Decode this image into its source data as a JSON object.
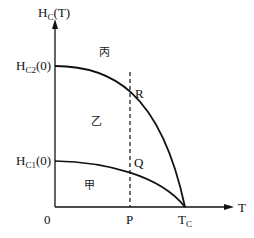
{
  "diagram": {
    "y_axis": {
      "label_main": "H",
      "label_sub": "C",
      "label_tail": "(T)"
    },
    "x_axis": {
      "label": "T"
    },
    "origin": "0",
    "hc2": {
      "main": "H",
      "sub": "C2",
      "tail": "(0)"
    },
    "hc1": {
      "main": "H",
      "sub": "C1",
      "tail": "(0)"
    },
    "tc": {
      "main": "T",
      "sub": "C"
    },
    "p": "P",
    "r": "R",
    "q": "Q",
    "regions": {
      "upper": "丙",
      "middle": "乙",
      "lower": "甲"
    }
  }
}
